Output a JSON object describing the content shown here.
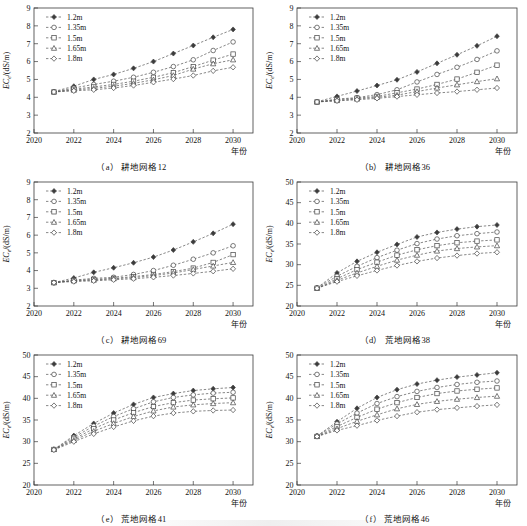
{
  "figure": {
    "series_labels": [
      "1.2m",
      "1.35m",
      "1.5m",
      "1.65m",
      "1.8m"
    ],
    "ylabel": "EC",
    "ylabel_sub": "e",
    "ylabel_unit": "/(dS/m)",
    "xlabel": "年份",
    "markers": [
      "filled-diamond",
      "open-circle",
      "open-square",
      "open-triangle",
      "open-diamond"
    ]
  },
  "chart_data": [
    {
      "type": "line",
      "panel": "a",
      "title": "耕地网格12",
      "caption_index": "（a）",
      "xlabel": "年份",
      "ylabel": "EC e /(dS/m)",
      "x": [
        2021,
        2022,
        2023,
        2024,
        2025,
        2026,
        2027,
        2028,
        2029,
        2030
      ],
      "xlim": [
        2020,
        2031
      ],
      "xticks": [
        2020,
        2022,
        2024,
        2026,
        2028,
        2030
      ],
      "ylim": [
        2,
        9
      ],
      "yticks": [
        2,
        3,
        4,
        5,
        6,
        7,
        8,
        9
      ],
      "grid": false,
      "legend_position": "top-left",
      "series": [
        {
          "name": "1.2m",
          "values": [
            4.32,
            4.62,
            5.0,
            5.28,
            5.62,
            6.0,
            6.45,
            6.9,
            7.36,
            7.8
          ]
        },
        {
          "name": "1.35m",
          "values": [
            4.3,
            4.52,
            4.72,
            4.9,
            5.12,
            5.4,
            5.72,
            6.1,
            6.62,
            7.1
          ]
        },
        {
          "name": "1.5m",
          "values": [
            4.3,
            4.45,
            4.58,
            4.72,
            4.9,
            5.12,
            5.38,
            5.72,
            6.08,
            6.42
          ]
        },
        {
          "name": "1.65m",
          "values": [
            4.3,
            4.4,
            4.5,
            4.62,
            4.78,
            4.98,
            5.22,
            5.58,
            5.88,
            6.1
          ]
        },
        {
          "name": "1.8m",
          "values": [
            4.3,
            4.36,
            4.42,
            4.52,
            4.66,
            4.84,
            5.02,
            5.22,
            5.48,
            5.68
          ]
        }
      ]
    },
    {
      "type": "line",
      "panel": "b",
      "title": "耕地网格36",
      "caption_index": "（b）",
      "xlabel": "年份",
      "ylabel": "EC e /(dS/m)",
      "x": [
        2021,
        2022,
        2023,
        2024,
        2025,
        2026,
        2027,
        2028,
        2029,
        2030
      ],
      "xlim": [
        2020,
        2031
      ],
      "xticks": [
        2020,
        2022,
        2024,
        2026,
        2028,
        2030
      ],
      "ylim": [
        2,
        9
      ],
      "yticks": [
        2,
        3,
        4,
        5,
        6,
        7,
        8,
        9
      ],
      "grid": false,
      "legend_position": "top-left",
      "series": [
        {
          "name": "1.2m",
          "values": [
            3.75,
            4.05,
            4.35,
            4.66,
            4.98,
            5.42,
            5.9,
            6.38,
            6.88,
            7.42
          ]
        },
        {
          "name": "1.35m",
          "values": [
            3.74,
            3.9,
            3.98,
            4.15,
            4.42,
            4.86,
            5.28,
            5.68,
            6.12,
            6.6
          ]
        },
        {
          "name": "1.5m",
          "values": [
            3.74,
            3.86,
            3.95,
            4.05,
            4.25,
            4.46,
            4.72,
            5.02,
            5.4,
            5.8
          ]
        },
        {
          "name": "1.65m",
          "values": [
            3.74,
            3.82,
            3.9,
            4.0,
            4.12,
            4.32,
            4.52,
            4.7,
            4.88,
            5.04
          ]
        },
        {
          "name": "1.8m",
          "values": [
            3.74,
            3.8,
            3.86,
            3.94,
            4.04,
            4.14,
            4.24,
            4.32,
            4.42,
            4.52
          ]
        }
      ]
    },
    {
      "type": "line",
      "panel": "c",
      "title": "耕地网格69",
      "caption_index": "（c）",
      "xlabel": "年份",
      "ylabel": "EC e /(dS/m)",
      "x": [
        2021,
        2022,
        2023,
        2024,
        2025,
        2026,
        2027,
        2028,
        2029,
        2030
      ],
      "xlim": [
        2020,
        2031
      ],
      "xticks": [
        2020,
        2022,
        2024,
        2026,
        2028,
        2030
      ],
      "ylim": [
        2,
        9
      ],
      "yticks": [
        2,
        3,
        4,
        5,
        6,
        7,
        8,
        9
      ],
      "grid": false,
      "legend_position": "top-left",
      "series": [
        {
          "name": "1.2m",
          "values": [
            3.32,
            3.58,
            3.9,
            4.16,
            4.44,
            4.76,
            5.16,
            5.62,
            6.1,
            6.62
          ]
        },
        {
          "name": "1.35m",
          "values": [
            3.32,
            3.46,
            3.56,
            3.62,
            3.78,
            4.0,
            4.3,
            4.64,
            5.0,
            5.4,
            5.78
          ]
        },
        {
          "name": "1.5m",
          "values": [
            3.32,
            3.44,
            3.5,
            3.56,
            3.66,
            3.78,
            3.94,
            4.14,
            4.46,
            4.9
          ]
        },
        {
          "name": "1.65m",
          "values": [
            3.32,
            3.42,
            3.46,
            3.54,
            3.6,
            3.72,
            3.86,
            4.06,
            4.26,
            4.46
          ]
        },
        {
          "name": "1.8m",
          "values": [
            3.32,
            3.38,
            3.42,
            3.48,
            3.54,
            3.62,
            3.72,
            3.84,
            3.96,
            4.1
          ]
        }
      ]
    },
    {
      "type": "line",
      "panel": "d",
      "title": "荒地网格38",
      "caption_index": "（d）",
      "xlabel": "年份",
      "ylabel": "EC e /(dS/m)",
      "x": [
        2021,
        2022,
        2023,
        2024,
        2025,
        2026,
        2027,
        2028,
        2029,
        2030
      ],
      "xlim": [
        2020,
        2031
      ],
      "xticks": [
        2020,
        2022,
        2024,
        2026,
        2028,
        2030
      ],
      "ylim": [
        20,
        50
      ],
      "yticks": [
        20,
        25,
        30,
        35,
        40,
        45,
        50
      ],
      "grid": false,
      "legend_position": "top-left",
      "series": [
        {
          "name": "1.2m",
          "values": [
            24.4,
            28.0,
            30.8,
            33.0,
            34.9,
            36.7,
            37.8,
            38.6,
            39.2,
            39.6
          ]
        },
        {
          "name": "1.35m",
          "values": [
            24.4,
            27.2,
            29.6,
            31.7,
            33.5,
            35.1,
            36.2,
            37.0,
            37.5,
            37.9
          ]
        },
        {
          "name": "1.5m",
          "values": [
            24.3,
            26.6,
            28.8,
            30.6,
            32.3,
            33.6,
            34.6,
            35.3,
            35.7,
            36.0
          ]
        },
        {
          "name": "1.65m",
          "values": [
            24.3,
            26.2,
            28.0,
            29.6,
            31.1,
            32.3,
            33.3,
            33.9,
            34.3,
            34.6
          ]
        },
        {
          "name": "1.8m",
          "values": [
            24.3,
            25.9,
            27.3,
            28.6,
            29.8,
            30.8,
            31.6,
            32.2,
            32.7,
            33.0
          ]
        }
      ]
    },
    {
      "type": "line",
      "panel": "e",
      "title": "荒地网格41",
      "caption_index": "（e）",
      "xlabel": "年份",
      "ylabel": "EC e /(dS/m)",
      "x": [
        2021,
        2022,
        2023,
        2024,
        2025,
        2026,
        2027,
        2028,
        2029,
        2030
      ],
      "xlim": [
        2020,
        2031
      ],
      "xticks": [
        2020,
        2022,
        2024,
        2026,
        2028,
        2030
      ],
      "ylim": [
        20,
        50
      ],
      "yticks": [
        20,
        25,
        30,
        35,
        40,
        45,
        50
      ],
      "grid": false,
      "legend_position": "top-left",
      "series": [
        {
          "name": "1.2m",
          "values": [
            28.2,
            31.4,
            34.2,
            36.6,
            38.6,
            40.2,
            41.1,
            41.8,
            42.2,
            42.5
          ]
        },
        {
          "name": "1.35m",
          "values": [
            28.2,
            31.0,
            33.6,
            35.8,
            37.6,
            39.2,
            40.2,
            40.8,
            41.2,
            41.4
          ]
        },
        {
          "name": "1.5m",
          "values": [
            28.2,
            30.6,
            33.0,
            35.0,
            36.7,
            38.1,
            39.0,
            39.6,
            39.9,
            40.1
          ]
        },
        {
          "name": "1.65m",
          "values": [
            28.2,
            30.3,
            32.4,
            34.2,
            35.8,
            37.1,
            38.0,
            38.5,
            38.8,
            39.0
          ]
        },
        {
          "name": "1.8m",
          "values": [
            28.1,
            30.0,
            31.8,
            33.4,
            34.8,
            35.9,
            36.6,
            37.0,
            37.2,
            37.3
          ]
        }
      ]
    },
    {
      "type": "line",
      "panel": "f",
      "title": "荒地网格46",
      "caption_index": "（f）",
      "xlabel": "年份",
      "ylabel": "EC e /(dS/m)",
      "x": [
        2021,
        2022,
        2023,
        2024,
        2025,
        2026,
        2027,
        2028,
        2029,
        2030
      ],
      "xlim": [
        2020,
        2031
      ],
      "xticks": [
        2020,
        2022,
        2024,
        2026,
        2028,
        2030
      ],
      "ylim": [
        20,
        50
      ],
      "yticks": [
        20,
        25,
        30,
        35,
        40,
        45,
        50
      ],
      "grid": false,
      "legend_position": "top-left",
      "series": [
        {
          "name": "1.2m",
          "values": [
            31.3,
            34.6,
            37.7,
            40.2,
            42.0,
            43.3,
            44.2,
            44.9,
            45.4,
            45.9
          ]
        },
        {
          "name": "1.35m",
          "values": [
            31.3,
            34.1,
            36.6,
            38.8,
            40.4,
            41.6,
            42.5,
            43.2,
            43.7,
            44.0
          ]
        },
        {
          "name": "1.5m",
          "values": [
            31.2,
            33.5,
            35.6,
            37.5,
            39.0,
            40.2,
            41.1,
            41.7,
            42.1,
            42.4
          ]
        },
        {
          "name": "1.65m",
          "values": [
            31.2,
            33.0,
            34.7,
            36.2,
            37.6,
            38.6,
            39.3,
            39.8,
            40.2,
            40.5
          ]
        },
        {
          "name": "1.8m",
          "values": [
            31.2,
            32.6,
            33.7,
            34.9,
            35.9,
            36.8,
            37.4,
            37.8,
            38.2,
            38.5
          ]
        }
      ]
    }
  ]
}
